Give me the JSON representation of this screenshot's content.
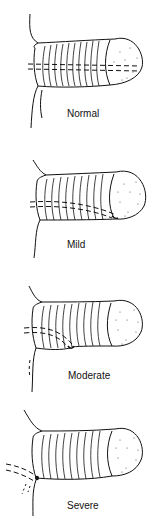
{
  "diagram": {
    "panels": [
      {
        "label": "Normal"
      },
      {
        "label": "Mild"
      },
      {
        "label": "Moderate"
      },
      {
        "label": "Severe"
      }
    ]
  }
}
